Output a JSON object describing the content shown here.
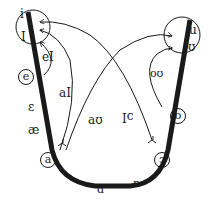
{
  "diagram": {
    "type": "vowel-diphthong-trajectory-chart",
    "colors": {
      "ink": "#1a1a1a",
      "background": "#ffffff"
    },
    "vowel_track": {
      "description": "thick U-shaped vowel track from high-front to low to high-back",
      "monophthongs_left": [
        "i",
        "I",
        "e",
        "ε",
        "æ",
        "a"
      ],
      "monophthongs_bottom": [
        "ɑ",
        "ɒ"
      ],
      "monophthongs_right": [
        "u",
        "ʊ",
        "o",
        "ɔ"
      ]
    },
    "labels": {
      "i": "i",
      "I": "I",
      "e": "e",
      "epsilon": "ε",
      "ae": "æ",
      "a": "a",
      "alpha": "ɑ",
      "turned_alpha": "ɒ",
      "u": "u",
      "upsilon": "ʊ",
      "o": "o",
      "open_o": "ɔ"
    },
    "diphthongs": [
      {
        "label": "eI",
        "from": "e",
        "to": "I"
      },
      {
        "label": "aI",
        "from": "a",
        "to": "i"
      },
      {
        "label": "aʊ",
        "from": "a",
        "to": "u"
      },
      {
        "label": "ɔI",
        "from": "ɔ",
        "to": "i"
      },
      {
        "label": "oʊ",
        "from": "o",
        "to": "ʊ"
      }
    ],
    "circled_regions": [
      "i/I target circle",
      "u/ʊ target circle"
    ]
  }
}
